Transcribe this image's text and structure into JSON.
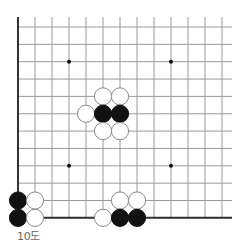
{
  "diagram": {
    "caption": "10도",
    "board": {
      "columns": 13,
      "rows": 12,
      "origin_x": 18,
      "origin_y": 27,
      "spacing_x": 17,
      "spacing_y": 17.35,
      "open_top_extend": 10,
      "open_right_extend": 10,
      "left_edge": true,
      "bottom_edge": true,
      "top_edge": false,
      "right_edge": false,
      "line_color": "#9a9a9a",
      "edge_color": "#333333",
      "stone_radius": 8.6
    },
    "star_points": [
      {
        "col": 3,
        "row": 2
      },
      {
        "col": 9,
        "row": 2
      },
      {
        "col": 3,
        "row": 8
      },
      {
        "col": 9,
        "row": 8
      }
    ],
    "stones": [
      {
        "color": "white",
        "col": 5,
        "row": 4
      },
      {
        "color": "white",
        "col": 6,
        "row": 4
      },
      {
        "color": "white",
        "col": 4,
        "row": 5
      },
      {
        "color": "black",
        "col": 5,
        "row": 5
      },
      {
        "color": "black",
        "col": 6,
        "row": 5
      },
      {
        "color": "white",
        "col": 5,
        "row": 6
      },
      {
        "color": "white",
        "col": 6,
        "row": 6
      },
      {
        "color": "black",
        "col": 0,
        "row": 10
      },
      {
        "color": "white",
        "col": 1,
        "row": 10
      },
      {
        "color": "black",
        "col": 0,
        "row": 11
      },
      {
        "color": "white",
        "col": 1,
        "row": 11
      },
      {
        "color": "white",
        "col": 6,
        "row": 10
      },
      {
        "color": "white",
        "col": 7,
        "row": 10
      },
      {
        "color": "white",
        "col": 5,
        "row": 11
      },
      {
        "color": "black",
        "col": 6,
        "row": 11
      },
      {
        "color": "black",
        "col": 7,
        "row": 11
      }
    ],
    "colors": {
      "black_stone": "#111111",
      "white_stone": "#ffffff",
      "white_stone_outline": "#8a8a8a",
      "star_point": "#111111"
    }
  }
}
